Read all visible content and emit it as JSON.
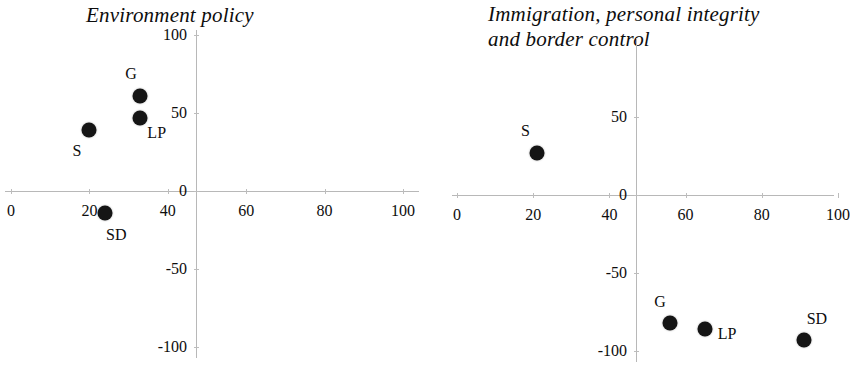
{
  "figure": {
    "background_color": "#ffffff",
    "marker_color": "#151515",
    "axis_color": "#b8b8b8",
    "text_color": "#0d0d0d"
  },
  "chart_data": [
    {
      "type": "scatter",
      "title": "Environment policy",
      "xlabel": "",
      "ylabel": "",
      "xlim": [
        0,
        100
      ],
      "ylim": [
        -100,
        100
      ],
      "xticks": [
        0,
        20,
        40,
        60,
        80,
        100
      ],
      "xtick_labels": [
        "0",
        "20",
        "40",
        "60",
        "80",
        "100"
      ],
      "yticks": [
        -100,
        -50,
        0,
        50,
        100
      ],
      "ytick_labels": [
        "-100",
        "-50",
        "0",
        "50",
        "100"
      ],
      "grid": false,
      "legend": "none",
      "points": [
        {
          "label": "G",
          "x": 33,
          "y": 61,
          "label_dx": -15,
          "label_dy": -22
        },
        {
          "label": "LP",
          "x": 33,
          "y": 47,
          "label_dx": 7,
          "label_dy": 15
        },
        {
          "label": "S",
          "x": 20,
          "y": 39,
          "label_dx": -17,
          "label_dy": 21
        },
        {
          "label": "SD",
          "x": 24,
          "y": -14,
          "label_dx": 1,
          "label_dy": 22
        }
      ]
    },
    {
      "type": "scatter",
      "title": "Immigration, personal integrity\nand border control",
      "xlabel": "",
      "ylabel": "",
      "xlim": [
        0,
        100
      ],
      "ylim": [
        -100,
        100
      ],
      "xticks": [
        0,
        20,
        40,
        60,
        80,
        100
      ],
      "xtick_labels": [
        "0",
        "20",
        "40",
        "60",
        "80",
        "100"
      ],
      "yticks": [
        -100,
        -50,
        0,
        50
      ],
      "ytick_labels": [
        "-100",
        "-50",
        "0",
        "50"
      ],
      "grid": false,
      "legend": "none",
      "points": [
        {
          "label": "S",
          "x": 21,
          "y": 27,
          "label_dx": -16,
          "label_dy": -22
        },
        {
          "label": "G",
          "x": 56,
          "y": -82,
          "label_dx": -16,
          "label_dy": -21
        },
        {
          "label": "LP",
          "x": 65,
          "y": -86,
          "label_dx": 13,
          "label_dy": 5
        },
        {
          "label": "SD",
          "x": 91,
          "y": -93,
          "label_dx": 3,
          "label_dy": -21
        }
      ]
    }
  ]
}
